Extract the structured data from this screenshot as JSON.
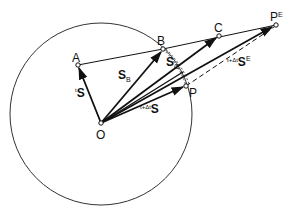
{
  "diagram": {
    "circle": {
      "cx": 101,
      "cy": 114,
      "r": 91
    },
    "points": {
      "O": {
        "x": 101,
        "y": 123,
        "label": "O"
      },
      "A": {
        "x": 78,
        "y": 65,
        "label": "A"
      },
      "B": {
        "x": 163,
        "y": 49,
        "label": "B"
      },
      "C": {
        "x": 219,
        "y": 36,
        "label": "C"
      },
      "PE": {
        "x": 276,
        "y": 25,
        "label": "P",
        "sup": "E"
      },
      "P": {
        "x": 186,
        "y": 86,
        "label": "P"
      }
    },
    "vector_labels": {
      "tS": {
        "pre": "t",
        "main": "S"
      },
      "SB": {
        "main": "S",
        "sub": "B"
      },
      "SC": {
        "main": "S",
        "sub": "C"
      },
      "tdtS": {
        "pre": "t+Δt",
        "main": "S"
      },
      "tdtSE": {
        "pre": "t+Δt",
        "main": "S",
        "sup": "E"
      }
    }
  }
}
